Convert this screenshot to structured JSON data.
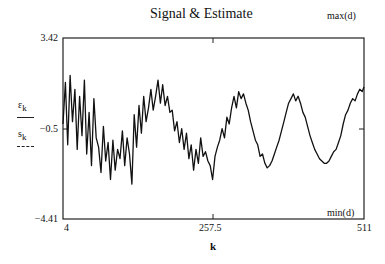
{
  "chart_data": {
    "type": "line",
    "title": "Signal & Estimate",
    "xlabel": "k",
    "ylabel": "",
    "xlim": [
      4,
      511
    ],
    "ylim": [
      -4.41,
      3.42
    ],
    "x_ticks": [
      "4",
      "257.5",
      "511"
    ],
    "y_ticks": [
      "3.42",
      "-0.5",
      "-4.41"
    ],
    "y_ticks_display": [
      "3.42",
      "−0.5",
      "−4.41"
    ],
    "annotations": {
      "top_right": "max(d)",
      "bottom_right": "min(d)"
    },
    "legend": [
      {
        "name": "ε",
        "sub": "k",
        "style": "solid"
      },
      {
        "name": "s",
        "sub": "k",
        "style": "dashed"
      }
    ],
    "series": [
      {
        "name": "noisy signal estimate",
        "x": [
          4,
          8,
          12,
          16,
          20,
          24,
          28,
          32,
          36,
          40,
          44,
          48,
          52,
          56,
          60,
          64,
          68,
          72,
          76,
          80,
          84,
          88,
          92,
          96,
          100,
          104,
          108,
          112,
          116,
          120,
          124,
          128,
          132,
          136,
          140,
          144,
          148,
          152,
          156,
          160,
          164,
          168,
          172,
          176,
          180,
          184,
          188,
          192,
          196,
          200,
          204,
          208,
          212,
          216,
          220,
          224,
          228,
          232,
          236,
          240,
          244,
          248,
          252,
          256,
          260,
          264,
          268,
          272,
          276,
          280,
          284,
          288,
          292,
          296,
          300,
          304,
          308,
          312,
          316,
          320,
          324,
          328,
          332,
          336,
          340,
          344,
          348,
          352,
          356,
          360,
          364,
          368,
          372,
          376,
          380,
          384,
          388,
          392,
          396,
          400,
          404,
          408,
          412,
          416,
          420,
          424,
          428,
          432,
          436,
          440,
          444,
          448,
          452,
          456,
          460,
          464,
          468,
          472,
          476,
          480,
          484,
          488,
          492,
          496,
          500,
          504,
          508,
          511
        ],
        "y": [
          -0.3,
          1.5,
          -1.2,
          1.8,
          -0.2,
          1.2,
          -1.4,
          0.9,
          -0.8,
          1.6,
          -1.6,
          0.2,
          -2.1,
          0.8,
          -0.9,
          -1.3,
          -2.4,
          -0.4,
          -1.9,
          -1.1,
          -2.7,
          -1.0,
          -2.3,
          -1.4,
          -1.8,
          -0.6,
          -2.1,
          -0.9,
          -1.6,
          -2.9,
          0.1,
          -1.3,
          0.5,
          -0.7,
          0.9,
          -0.2,
          0.4,
          1.2,
          0.3,
          0.9,
          1.6,
          0.6,
          1.4,
          0.5,
          0.9,
          0.2,
          0.3,
          -0.6,
          -0.2,
          -1.1,
          -0.5,
          -1.4,
          -0.7,
          -1.8,
          -1.2,
          -2.3,
          -1.4,
          -2.0,
          -0.9,
          -1.7,
          -1.5,
          -1.9,
          -2.1,
          -2.7,
          -1.7,
          -1.3,
          -1.0,
          -0.5,
          -0.9,
          0.0,
          -0.3,
          0.4,
          0.9,
          0.4,
          1.1,
          0.8,
          1.0,
          0.6,
          0.3,
          -0.2,
          -0.6,
          -1.0,
          -1.2,
          -1.7,
          -1.6,
          -2.0,
          -2.2,
          -2.1,
          -1.9,
          -1.6,
          -1.3,
          -1.0,
          -0.6,
          -0.2,
          0.2,
          0.6,
          0.8,
          1.0,
          0.7,
          0.9,
          0.6,
          0.2,
          0.0,
          -0.4,
          -0.8,
          -1.1,
          -1.4,
          -1.6,
          -1.8,
          -1.9,
          -2.0,
          -2.0,
          -1.9,
          -1.7,
          -1.5,
          -1.4,
          -1.1,
          -0.8,
          -0.3,
          0.1,
          0.3,
          0.6,
          0.8,
          0.7,
          1.0,
          1.2,
          1.1,
          1.3
        ]
      }
    ],
    "grid": false,
    "legend_position": "left"
  }
}
